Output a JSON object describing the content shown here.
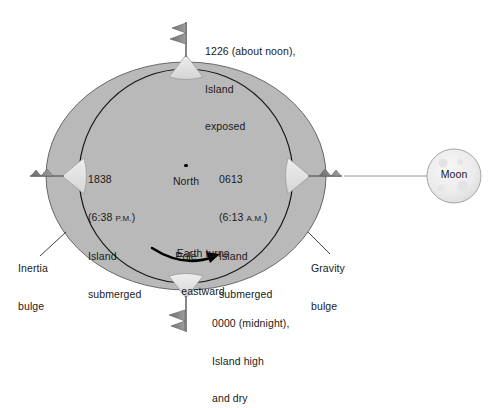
{
  "diagram": {
    "background_color": "#ffffff",
    "earth_fill": "#b9b9b9",
    "earth_stroke": "#3c3c3c",
    "inner_circle_stroke": "#1a1a1a",
    "island_fill": "#e2e2e2",
    "flag_fill": "#7d7d7d",
    "moon_fill": "#ebebeb",
    "moon_stroke": "#9a9a9a",
    "leader_line_color": "#4a4a4a"
  },
  "labels": {
    "noon": {
      "line1": "1226 (about noon),",
      "line2": "Island",
      "line3": "exposed"
    },
    "evening": {
      "line1": "1838",
      "time_prefix": "(6:38 ",
      "time_meridiem": "P.M.",
      "time_suffix": ")",
      "line3": "Island",
      "line4": "submerged"
    },
    "morning": {
      "line1": "0613",
      "time_prefix": "(6:13 ",
      "time_meridiem": "A.M.",
      "time_suffix": ")",
      "line3": "Island",
      "line4": "submerged"
    },
    "midnight": {
      "line1": "0000 (midnight),",
      "line2": "Island high",
      "line3": "and dry"
    },
    "north_pole": {
      "line1": "North",
      "line2": "Pole"
    },
    "rotation": {
      "line1": "Earth turns",
      "line2": "eastward"
    },
    "inertia_bulge": {
      "line1": "Inertia",
      "line2": "bulge"
    },
    "gravity_bulge": {
      "line1": "Gravity",
      "line2": "bulge"
    },
    "moon": {
      "name": "Moon"
    }
  }
}
